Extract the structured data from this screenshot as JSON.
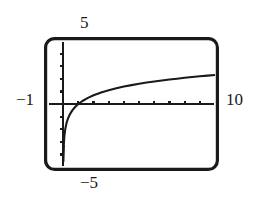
{
  "figure": {
    "name": "graphing-calculator-logarithm-plot",
    "background_color": "#ffffff",
    "ink_color": "#1a1a1a"
  },
  "labels": {
    "y_max": "5",
    "y_min": "−5",
    "x_min": "−1",
    "x_max": "10"
  },
  "chart_data": {
    "type": "line",
    "title": "",
    "xlabel": "",
    "ylabel": "",
    "xlim": [
      -1,
      10
    ],
    "ylim": [
      -5,
      5
    ],
    "grid": false,
    "legend": null,
    "axis_style": "calculator-window-with-tick-marks",
    "x_ticks": [
      -1,
      0,
      1,
      2,
      3,
      4,
      5,
      6,
      7,
      8,
      9,
      10
    ],
    "y_ticks": [
      -5,
      -4,
      -3,
      -2,
      -1,
      0,
      1,
      2,
      3,
      4,
      5
    ],
    "tick_labels_shown": false,
    "window_corner_labels": {
      "top": "5",
      "bottom": "−5",
      "left": "−1",
      "right": "10"
    },
    "series": [
      {
        "name": "y = ln(x)",
        "function": "natural logarithm",
        "asymptote_x": 0,
        "x_intercept": 1,
        "x": [
          0.04,
          0.08,
          0.14,
          0.22,
          0.32,
          0.45,
          0.6,
          0.8,
          1.0,
          1.3,
          1.6,
          2.0,
          2.5,
          3.0,
          3.5,
          4.0,
          4.5,
          5.0,
          5.5,
          6.0,
          6.5,
          7.0,
          7.5,
          8.0,
          8.5,
          9.0,
          9.5,
          10.0
        ],
        "y": [
          -3.22,
          -2.53,
          -1.97,
          -1.51,
          -1.14,
          -0.8,
          -0.51,
          -0.22,
          0.0,
          0.26,
          0.47,
          0.69,
          0.92,
          1.1,
          1.25,
          1.39,
          1.5,
          1.61,
          1.7,
          1.79,
          1.87,
          1.95,
          2.01,
          2.08,
          2.14,
          2.2,
          2.25,
          2.3
        ]
      }
    ]
  }
}
